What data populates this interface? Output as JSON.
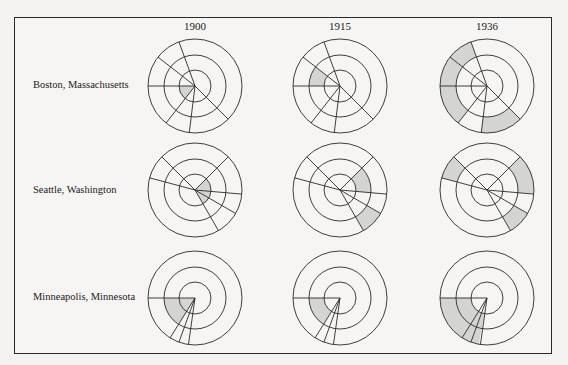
{
  "diagram": {
    "columns": [
      {
        "label": "1900",
        "cx": 195
      },
      {
        "label": "1915",
        "cx": 340
      },
      {
        "label": "1936",
        "cx": 487
      }
    ],
    "rows": [
      {
        "label": "Boston, Massachusetts",
        "cy": 86,
        "rays": [
          180,
          218,
          250,
          45,
          97,
          128
        ],
        "cells": [
          {
            "shaded": [
              {
                "ring": 0,
                "from": 128,
                "to": 180
              }
            ]
          },
          {
            "shaded": [
              {
                "ring": 1,
                "from": 180,
                "to": 218
              }
            ]
          },
          {
            "shaded": [
              {
                "ring": 2,
                "from": 128,
                "to": 250
              },
              {
                "ring": 2,
                "from": 45,
                "to": 97
              }
            ]
          }
        ]
      },
      {
        "label": "Seattle, Washington",
        "cy": 190,
        "rays": [
          195,
          225,
          315,
          5,
          30,
          60
        ],
        "cells": [
          {
            "shaded": [
              {
                "ring": 0,
                "from": -45,
                "to": 60
              }
            ]
          },
          {
            "shaded": [
              {
                "ring": 1,
                "from": -45,
                "to": 5
              },
              {
                "ring": 2,
                "from": 30,
                "to": 60
              }
            ]
          },
          {
            "shaded": [
              {
                "ring": 2,
                "from": 195,
                "to": 225
              },
              {
                "ring": 2,
                "from": -45,
                "to": 5
              },
              {
                "ring": 2,
                "from": 30,
                "to": 60
              }
            ]
          }
        ]
      },
      {
        "label": "Minneapolis, Minnesota",
        "cy": 298,
        "rays": [
          180,
          122,
          110,
          98
        ],
        "cells": [
          {
            "shaded": [
              {
                "ring": 0,
                "from": 122,
                "to": 180
              },
              {
                "ring": 1,
                "from": 122,
                "to": 180
              }
            ]
          },
          {
            "shaded": [
              {
                "ring": 1,
                "from": 122,
                "to": 180
              }
            ]
          },
          {
            "shaded": [
              {
                "ring": 1,
                "from": 100,
                "to": 180
              },
              {
                "ring": 2,
                "from": 100,
                "to": 180
              }
            ]
          }
        ]
      }
    ],
    "radii": [
      16,
      31,
      47
    ],
    "colors": {
      "stroke": "#2a2a2a",
      "shade": "#d4d4d2",
      "background": "#f6f5f3"
    }
  }
}
